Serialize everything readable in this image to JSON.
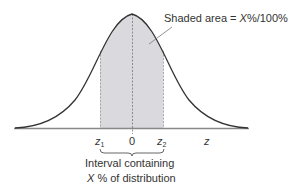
{
  "figure": {
    "annotation": {
      "prefix": "Shaded area = ",
      "x_var": "X",
      "suffix": "%/100%"
    },
    "axis": {
      "labels": [
        {
          "id": "z1",
          "base": "z",
          "sub": "1"
        },
        {
          "id": "zero",
          "base": "0"
        },
        {
          "id": "z2",
          "base": "z",
          "sub": "2"
        },
        {
          "id": "z",
          "base": "z"
        }
      ]
    },
    "interval_caption": {
      "line1": "Interval containing",
      "line2_var": "X",
      "line2_rest": " % of distribution"
    },
    "colors": {
      "curve": "#333333",
      "shade": "#d9d9de",
      "axis": "#888888",
      "dashed": "#777777",
      "text": "#333333"
    }
  }
}
